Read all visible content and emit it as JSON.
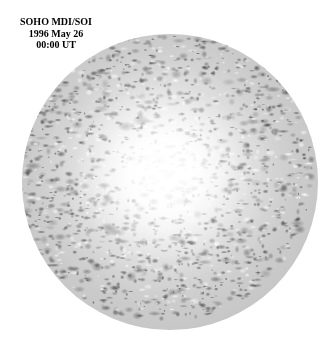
{
  "figure": {
    "name": "soho-mdi-soi-solar-disk",
    "background_color": "#ffffff",
    "width": 332,
    "height": 358
  },
  "caption": {
    "line1": "SOHO MDI/SOI",
    "line2": "1996 May 26",
    "line3": "00:00 UT",
    "instrument": "SOHO MDI/SOI",
    "date": "1996 May 26",
    "time": "00:00 UT",
    "text_color": "#000000",
    "font_size_px": 10
  },
  "solar_disk": {
    "label": "full-disk-solar-image",
    "center_x": 170,
    "center_y": 182,
    "radius": 148,
    "diameter": 296,
    "left": 22,
    "top": 34,
    "core_color": "#fdfdfd",
    "mid_color": "#d6d6d6",
    "limb_color": "#bdbdbd",
    "speckle_dark_color": "#3a3a3a",
    "speckle_light_color": "#ffffff",
    "description": "Granular speckled full solar disk, bright washed-out center with dark mottling increasing toward the limb"
  }
}
